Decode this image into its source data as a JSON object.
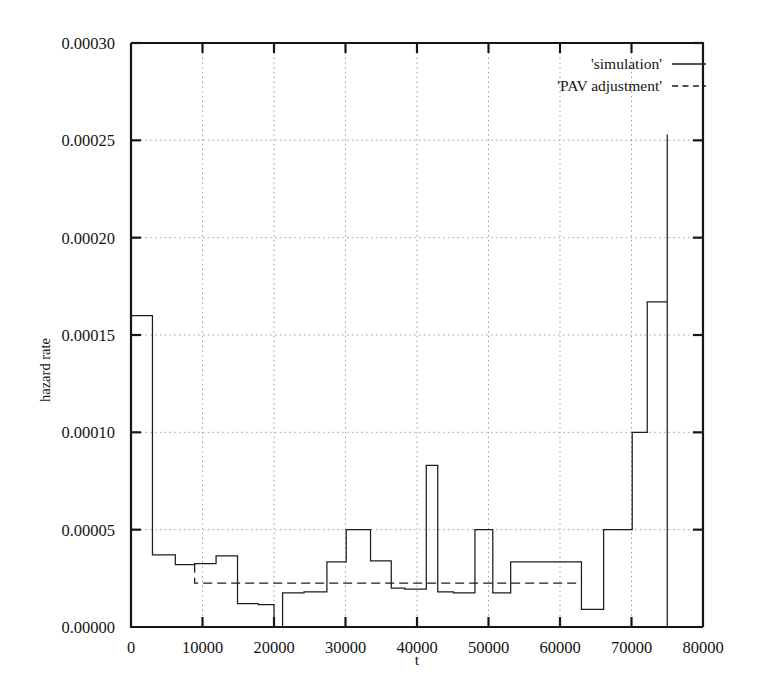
{
  "chart_data": {
    "type": "line",
    "subtype": "step-post",
    "title": "",
    "xlabel": "t",
    "ylabel": "hazard rate",
    "xlim": [
      0,
      80000
    ],
    "ylim": [
      0.0,
      0.0003
    ],
    "xticks": [
      0,
      10000,
      20000,
      30000,
      40000,
      50000,
      60000,
      70000,
      80000
    ],
    "xtick_labels": [
      "0",
      "10000",
      "20000",
      "30000",
      "40000",
      "50000",
      "60000",
      "70000",
      "80000"
    ],
    "yticks": [
      0.0,
      5e-05,
      0.0001,
      0.00015,
      0.0002,
      0.00025,
      0.0003
    ],
    "ytick_labels": [
      "0.00000",
      "0.00005",
      "0.00010",
      "0.00015",
      "0.00020",
      "0.00025",
      "0.00030"
    ],
    "grid": true,
    "grid_style": "dotted",
    "legend_position": "top-right",
    "series": [
      {
        "name": "'simulation'",
        "style": "solid",
        "color": "#1d1d1d",
        "x": [
          0,
          3000,
          6200,
          8900,
          11900,
          14900,
          17800,
          20000,
          21200,
          24200,
          27400,
          30100,
          33500,
          36400,
          38300,
          41300,
          42900,
          45100,
          48100,
          50600,
          53100,
          60100,
          63000,
          66100,
          70100,
          72200,
          75000,
          75000
        ],
        "y": [
          0.00016,
          3.7e-05,
          3.2e-05,
          3.25e-05,
          3.65e-05,
          1.2e-05,
          1.15e-05,
          0.0,
          1.75e-05,
          1.8e-05,
          3.35e-05,
          5e-05,
          3.4e-05,
          2e-05,
          1.95e-05,
          8.3e-05,
          1.8e-05,
          1.75e-05,
          5e-05,
          1.75e-05,
          3.35e-05,
          3.35e-05,
          9e-06,
          5e-05,
          0.0001,
          0.000167,
          0.000253,
          0.0
        ]
      },
      {
        "name": "'PAV adjustment'",
        "style": "dashed",
        "color": "#1d1d1d",
        "x": [
          8900,
          8900,
          63000
        ],
        "y": [
          3.25e-05,
          2.25e-05,
          2.25e-05
        ]
      }
    ]
  },
  "legend": {
    "entries": [
      {
        "label": "'simulation'",
        "style": "solid"
      },
      {
        "label": "'PAV adjustment'",
        "style": "dashed"
      }
    ]
  },
  "axes": {
    "x_title": "t",
    "y_title": "hazard rate"
  }
}
